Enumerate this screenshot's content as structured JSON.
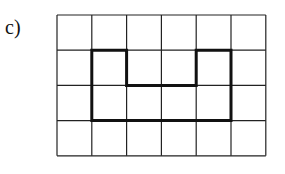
{
  "label": "c)",
  "grid": {
    "columns": 6,
    "rows": 4,
    "origin_x": 57,
    "origin_y": 15,
    "cell_w": 34.8,
    "cell_h": 35.2,
    "line_color": "#222222",
    "line_width": 1.2
  },
  "shape": {
    "description": "Bold outline polygon drawn on grid (U-shaped notch on top)",
    "vertices_grid": [
      [
        1,
        1
      ],
      [
        2,
        1
      ],
      [
        2,
        2
      ],
      [
        4,
        2
      ],
      [
        4,
        1
      ],
      [
        5,
        1
      ],
      [
        5,
        3
      ],
      [
        1,
        3
      ]
    ],
    "stroke_color": "#111111",
    "stroke_width": 3
  }
}
